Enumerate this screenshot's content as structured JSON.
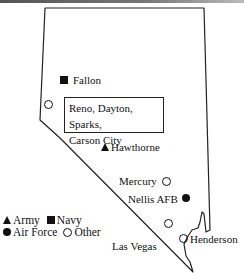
{
  "map": {
    "region": "Nevada",
    "outline_color": "#222222",
    "grouped_box": {
      "label_line1": "Reno, Dayton, Sparks,",
      "label_line2": "Carson City",
      "symbol": "other"
    },
    "sites": [
      {
        "name": "Fallon",
        "label": "Fallon",
        "type": "navy"
      },
      {
        "name": "Hawthorne",
        "label": "Hawthorne",
        "type": "army"
      },
      {
        "name": "Mercury",
        "label": "Mercury",
        "type": "other"
      },
      {
        "name": "Nellis AFB",
        "label": "Nellis AFB",
        "type": "air-force"
      },
      {
        "name": "Las Vegas",
        "label": "Las Vegas",
        "type": "other"
      },
      {
        "name": "Henderson",
        "label": "Henderson",
        "type": "other"
      }
    ]
  },
  "legend": {
    "army": "Army",
    "navy": "Navy",
    "air_force": "Air Force",
    "other": "Other"
  }
}
